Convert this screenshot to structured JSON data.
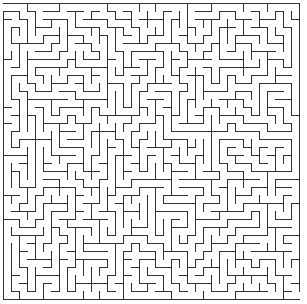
{
  "maze": {
    "cols": 37,
    "rows": 37,
    "cell_size": 8,
    "origin_x": 3,
    "origin_y": 3,
    "wall_color": "#333333",
    "background_color": "#ffffff",
    "wall_width": 1,
    "seed": 20240917,
    "entrance": {
      "side": "left",
      "row": 0
    },
    "exit": {
      "side": "right",
      "row": 36
    }
  }
}
